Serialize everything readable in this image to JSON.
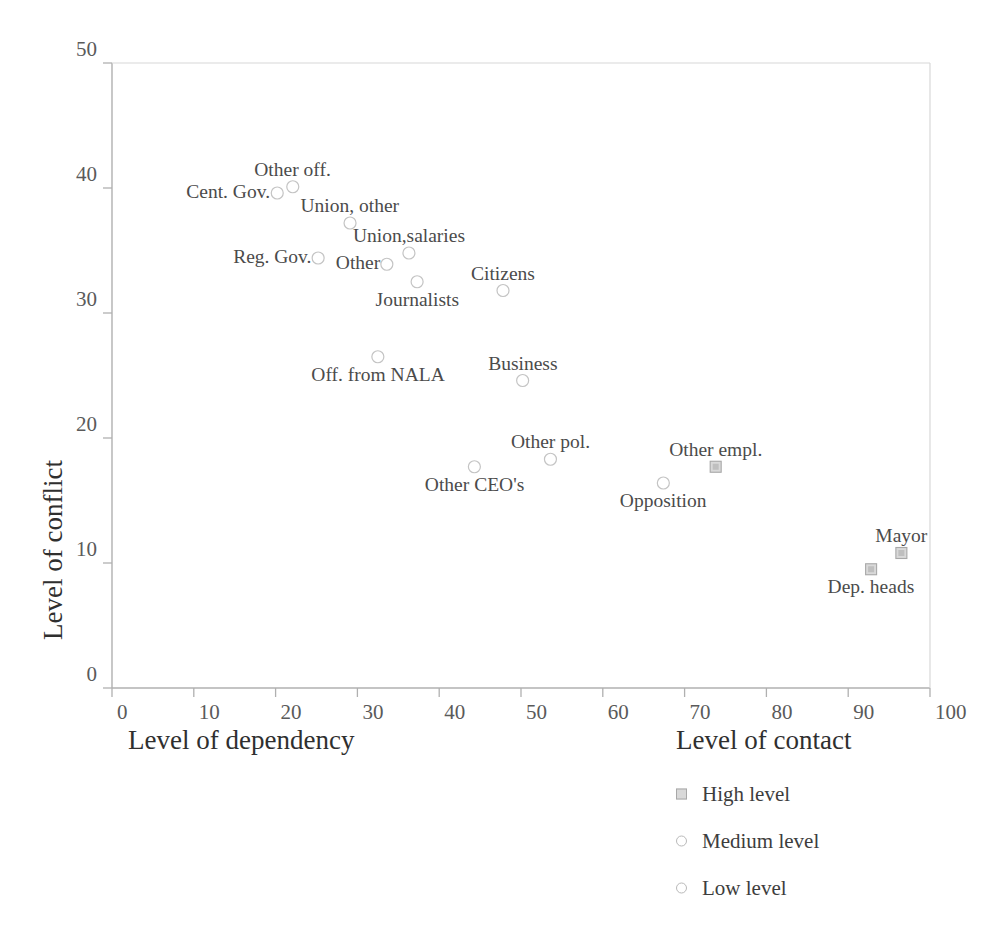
{
  "chart_data": {
    "type": "scatter",
    "title": "",
    "xlabel": "Level of dependency",
    "ylabel": "Level of conflict",
    "xlim": [
      0,
      100
    ],
    "ylim": [
      0,
      50
    ],
    "xticks": [
      0,
      10,
      20,
      30,
      40,
      50,
      60,
      70,
      80,
      90,
      100
    ],
    "yticks": [
      0,
      10,
      20,
      30,
      40,
      50
    ],
    "grid": false,
    "legend_title": "Level of contact",
    "legend_position": "below-right",
    "legend": [
      {
        "label": "High level",
        "marker": "square"
      },
      {
        "label": "Medium level",
        "marker": "circle"
      },
      {
        "label": "Low level",
        "marker": "circle"
      }
    ],
    "points": [
      {
        "label": "Cent. Gov.",
        "x": 20.2,
        "y": 39.6,
        "marker": "circle",
        "label_pos": "left"
      },
      {
        "label": "Other off.",
        "x": 22.1,
        "y": 40.1,
        "marker": "circle",
        "label_pos": "above"
      },
      {
        "label": "Union, other",
        "x": 29.1,
        "y": 37.2,
        "marker": "circle",
        "label_pos": "above"
      },
      {
        "label": "Reg. Gov.",
        "x": 25.2,
        "y": 34.4,
        "marker": "circle",
        "label_pos": "left"
      },
      {
        "label": "Other",
        "x": 33.6,
        "y": 33.9,
        "marker": "circle",
        "label_pos": "left"
      },
      {
        "label": "Union,salaries",
        "x": 36.3,
        "y": 34.8,
        "marker": "circle",
        "label_pos": "above"
      },
      {
        "label": "Journalists",
        "x": 37.3,
        "y": 32.5,
        "marker": "circle",
        "label_pos": "below"
      },
      {
        "label": "Citizens",
        "x": 47.8,
        "y": 31.8,
        "marker": "circle",
        "label_pos": "above"
      },
      {
        "label": "Off. from NALA",
        "x": 32.5,
        "y": 26.5,
        "marker": "circle",
        "label_pos": "below"
      },
      {
        "label": "Business",
        "x": 50.2,
        "y": 24.6,
        "marker": "circle",
        "label_pos": "above"
      },
      {
        "label": "Other CEO's",
        "x": 44.3,
        "y": 17.7,
        "marker": "circle",
        "label_pos": "below"
      },
      {
        "label": "Other pol.",
        "x": 53.6,
        "y": 18.3,
        "marker": "circle",
        "label_pos": "above"
      },
      {
        "label": "Opposition",
        "x": 67.4,
        "y": 16.4,
        "marker": "circle",
        "label_pos": "below"
      },
      {
        "label": "Other empl.",
        "x": 73.8,
        "y": 17.7,
        "marker": "square",
        "label_pos": "above"
      },
      {
        "label": "Mayor",
        "x": 96.5,
        "y": 10.8,
        "marker": "square",
        "label_pos": "above"
      },
      {
        "label": "Dep. heads",
        "x": 92.8,
        "y": 9.5,
        "marker": "square",
        "label_pos": "below"
      }
    ]
  },
  "colors": {
    "axis": "#b0b0b0",
    "marker_circle_stroke": "#c4c4c4",
    "marker_square_stroke": "#a8a8a8",
    "marker_square_fill": "#d9d9d9",
    "text": "#3d3d3d",
    "background": "#ffffff"
  }
}
